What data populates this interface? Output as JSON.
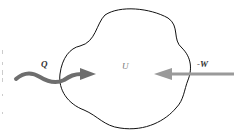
{
  "diagram": {
    "labels": {
      "heat": "Q",
      "internal_energy": "U",
      "work": "-W"
    },
    "colors": {
      "outline": "#111111",
      "heat_arrow": "#6e6e6e",
      "work_arrow": "#9a9a9a",
      "background": "#ffffff"
    }
  }
}
